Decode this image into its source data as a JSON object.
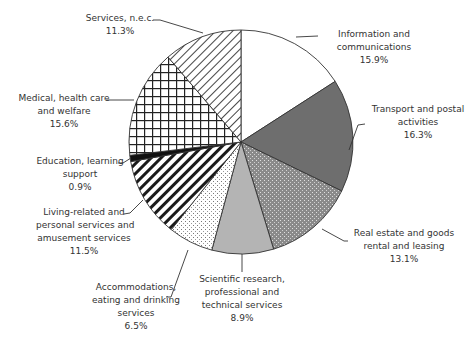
{
  "chart_data": {
    "type": "pie",
    "title": "",
    "start_angle": "12 o'clock",
    "direction": "clockwise",
    "slices": [
      {
        "label": "Information and communications",
        "value": 15.9,
        "display": "15.9%",
        "fill": "white"
      },
      {
        "label": "Transport and postal activities",
        "value": 16.3,
        "display": "16.3%",
        "fill": "dark-gray"
      },
      {
        "label": "Real estate and goods rental and leasing",
        "value": 13.1,
        "display": "13.1%",
        "fill": "dotted-dark"
      },
      {
        "label": "Scientific research, professional and technical services",
        "value": 8.9,
        "display": "8.9%",
        "fill": "light-gray"
      },
      {
        "label": "Accommodations, eating and drinking services",
        "value": 6.5,
        "display": "6.5%",
        "fill": "fine-dots"
      },
      {
        "label": "Living-related and personal services and amusement services",
        "value": 11.5,
        "display": "11.5%",
        "fill": "bold-diagonal"
      },
      {
        "label": "Education, learning support",
        "value": 0.9,
        "display": "0.9%",
        "fill": "black"
      },
      {
        "label": "Medical, health care and welfare",
        "value": 15.6,
        "display": "15.6%",
        "fill": "grid"
      },
      {
        "label": "Services, n.e.c.",
        "value": 11.3,
        "display": "11.3%",
        "fill": "thin-diagonal"
      }
    ]
  },
  "labels": {
    "info": {
      "l1": "Information and",
      "l2": "communications",
      "pct": "15.9%"
    },
    "transport": {
      "l1": "Transport and postal",
      "l2": "activities",
      "pct": "16.3%"
    },
    "realestate": {
      "l1": "Real estate and goods",
      "l2": "rental and leasing",
      "pct": "13.1%"
    },
    "scientific": {
      "l1": "Scientific research,",
      "l2": "professional and",
      "l3": "technical services",
      "pct": "8.9%"
    },
    "accommodations": {
      "l1": "Accommodations,",
      "l2": "eating and drinking",
      "l3": "services",
      "pct": "6.5%"
    },
    "living": {
      "l1": "Living-related and",
      "l2": "personal services and",
      "l3": "amusement services",
      "pct": "11.5%"
    },
    "education": {
      "l1": "Education, learning",
      "l2": "support",
      "pct": "0.9%"
    },
    "medical": {
      "l1": "Medical, health care",
      "l2": "and welfare",
      "pct": "15.6%"
    },
    "services": {
      "l1": "Services, n.e.c.",
      "pct": "11.3%"
    }
  }
}
